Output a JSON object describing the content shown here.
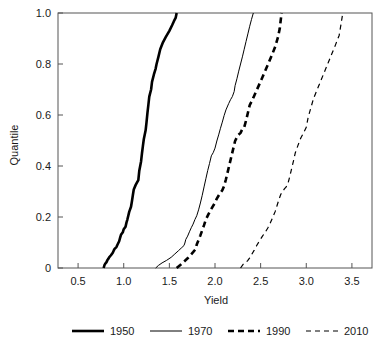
{
  "chart_data": {
    "type": "line",
    "title": "",
    "xlabel": "Yield",
    "ylabel": "Quantile",
    "xlim": [
      0.28,
      3.72
    ],
    "ylim": [
      0.0,
      1.0
    ],
    "grid": false,
    "legend_position": "bottom",
    "xticks": [
      0.5,
      1.0,
      1.5,
      2.0,
      2.5,
      3.0,
      3.5
    ],
    "xtick_labels": [
      "0.5",
      "1.0",
      "1.5",
      "2.0",
      "2.5",
      "3.0",
      "3.5"
    ],
    "yticks": [
      0.0,
      0.2,
      0.4,
      0.6,
      0.8,
      1.0
    ],
    "ytick_labels": [
      "0",
      "0.2",
      "0.4",
      "0.6",
      "0.8",
      "1.0"
    ],
    "series": [
      {
        "name": "1950",
        "style": "thick-solid",
        "color": "#000000",
        "x": [
          0.78,
          0.79,
          0.8,
          0.81,
          0.82,
          0.83,
          0.84,
          0.86,
          0.88,
          0.89,
          0.9,
          0.92,
          0.93,
          0.95,
          0.96,
          0.97,
          0.99,
          1.0,
          1.02,
          1.03,
          1.04,
          1.05,
          1.06,
          1.08,
          1.09,
          1.1,
          1.11,
          1.13,
          1.14,
          1.16,
          1.17,
          1.19,
          1.2,
          1.21,
          1.22,
          1.24,
          1.25,
          1.26,
          1.27,
          1.28,
          1.3,
          1.31,
          1.33,
          1.35,
          1.36,
          1.38,
          1.4,
          1.43,
          1.46,
          1.5,
          1.53,
          1.55,
          1.57,
          1.58
        ],
        "y": [
          0.0,
          0.012,
          0.018,
          0.022,
          0.03,
          0.035,
          0.042,
          0.05,
          0.06,
          0.068,
          0.075,
          0.082,
          0.09,
          0.105,
          0.118,
          0.13,
          0.14,
          0.152,
          0.162,
          0.178,
          0.19,
          0.205,
          0.22,
          0.24,
          0.262,
          0.285,
          0.308,
          0.325,
          0.332,
          0.345,
          0.38,
          0.418,
          0.45,
          0.478,
          0.505,
          0.54,
          0.572,
          0.608,
          0.64,
          0.672,
          0.7,
          0.73,
          0.758,
          0.782,
          0.8,
          0.828,
          0.858,
          0.885,
          0.905,
          0.93,
          0.952,
          0.968,
          0.982,
          1.0
        ]
      },
      {
        "name": "1970",
        "style": "thin-solid",
        "color": "#000000",
        "x": [
          1.35,
          1.38,
          1.42,
          1.47,
          1.52,
          1.56,
          1.6,
          1.63,
          1.66,
          1.67,
          1.68,
          1.7,
          1.72,
          1.74,
          1.76,
          1.78,
          1.8,
          1.82,
          1.84,
          1.86,
          1.88,
          1.9,
          1.92,
          1.94,
          1.96,
          1.98,
          2.0,
          2.02,
          2.04,
          2.06,
          2.08,
          2.1,
          2.12,
          2.15,
          2.17,
          2.19,
          2.21,
          2.22,
          2.24,
          2.26,
          2.28,
          2.3,
          2.32,
          2.34,
          2.36,
          2.38,
          2.4,
          2.42
        ],
        "y": [
          0.0,
          0.01,
          0.02,
          0.03,
          0.042,
          0.055,
          0.068,
          0.078,
          0.088,
          0.098,
          0.112,
          0.125,
          0.142,
          0.158,
          0.172,
          0.19,
          0.205,
          0.228,
          0.255,
          0.285,
          0.318,
          0.35,
          0.382,
          0.41,
          0.44,
          0.452,
          0.47,
          0.498,
          0.522,
          0.548,
          0.572,
          0.598,
          0.62,
          0.645,
          0.66,
          0.672,
          0.692,
          0.715,
          0.742,
          0.772,
          0.8,
          0.828,
          0.858,
          0.888,
          0.918,
          0.948,
          0.975,
          1.0
        ]
      },
      {
        "name": "1990",
        "style": "thick-dashed",
        "color": "#000000",
        "x": [
          1.58,
          1.62,
          1.66,
          1.7,
          1.73,
          1.76,
          1.79,
          1.8,
          1.82,
          1.84,
          1.86,
          1.88,
          1.9,
          1.93,
          1.96,
          1.99,
          2.02,
          2.05,
          2.08,
          2.1,
          2.12,
          2.14,
          2.16,
          2.18,
          2.2,
          2.22,
          2.25,
          2.28,
          2.3,
          2.32,
          2.34,
          2.36,
          2.38,
          2.42,
          2.46,
          2.5,
          2.54,
          2.58,
          2.62,
          2.66,
          2.69,
          2.71,
          2.72,
          2.73
        ],
        "y": [
          0.0,
          0.012,
          0.025,
          0.038,
          0.05,
          0.062,
          0.075,
          0.092,
          0.11,
          0.128,
          0.148,
          0.168,
          0.19,
          0.212,
          0.232,
          0.25,
          0.272,
          0.29,
          0.305,
          0.322,
          0.348,
          0.378,
          0.408,
          0.438,
          0.468,
          0.498,
          0.52,
          0.53,
          0.545,
          0.552,
          0.578,
          0.608,
          0.638,
          0.668,
          0.7,
          0.732,
          0.765,
          0.798,
          0.832,
          0.868,
          0.905,
          0.94,
          0.972,
          1.0
        ]
      },
      {
        "name": "2010",
        "style": "thin-dashed",
        "color": "#000000",
        "x": [
          2.28,
          2.31,
          2.34,
          2.36,
          2.38,
          2.4,
          2.43,
          2.46,
          2.49,
          2.52,
          2.55,
          2.58,
          2.6,
          2.62,
          2.64,
          2.66,
          2.68,
          2.7,
          2.72,
          2.74,
          2.76,
          2.78,
          2.8,
          2.82,
          2.84,
          2.86,
          2.88,
          2.91,
          2.94,
          2.97,
          3.0,
          3.02,
          3.05,
          3.08,
          3.12,
          3.16,
          3.2,
          3.24,
          3.28,
          3.32,
          3.36,
          3.38,
          3.4
        ],
        "y": [
          0.0,
          0.015,
          0.022,
          0.03,
          0.04,
          0.052,
          0.07,
          0.09,
          0.108,
          0.125,
          0.14,
          0.158,
          0.172,
          0.188,
          0.205,
          0.222,
          0.245,
          0.268,
          0.288,
          0.3,
          0.31,
          0.318,
          0.332,
          0.36,
          0.39,
          0.42,
          0.452,
          0.482,
          0.51,
          0.53,
          0.552,
          0.59,
          0.628,
          0.665,
          0.7,
          0.735,
          0.77,
          0.805,
          0.84,
          0.875,
          0.912,
          0.955,
          1.0
        ]
      }
    ]
  },
  "legend": {
    "items": [
      {
        "label": "1950",
        "style": "thick-solid"
      },
      {
        "label": "1970",
        "style": "thin-solid"
      },
      {
        "label": "1990",
        "style": "thick-dashed"
      },
      {
        "label": "2010",
        "style": "thin-dashed"
      }
    ]
  }
}
